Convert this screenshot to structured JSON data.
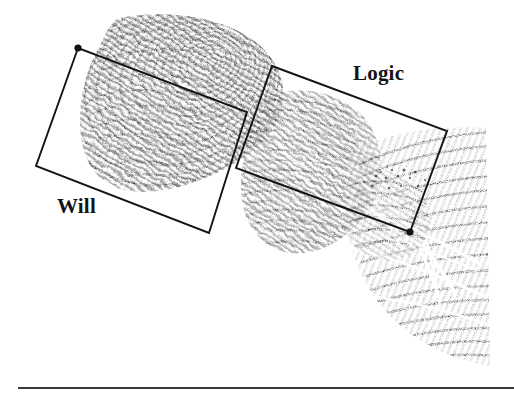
{
  "figure": {
    "caption_rule_visible": true,
    "background_color": "#ffffff",
    "ink_color": "#141414",
    "media": {
      "kind": "scanned-photograph",
      "subject": "fingerprint-impression",
      "description": "Rolled fingerprint and finger-joint impressions running diagonally from upper left to lower right"
    },
    "annotations": [
      {
        "id": "will",
        "label": "Will",
        "region": "upper-left fingertip whorl impression",
        "marker": "leader-dot",
        "box_corners": [
          [
            78,
            48
          ],
          [
            36,
            166
          ],
          [
            209,
            233
          ],
          [
            247,
            112
          ]
        ],
        "dot": [
          78,
          48
        ],
        "label_position": [
          57,
          194
        ]
      },
      {
        "id": "logic",
        "label": "Logic",
        "region": "middle and lower finger-joint impressions",
        "marker": "leader-dot",
        "box_corners": [
          [
            272,
            66
          ],
          [
            447,
            131
          ],
          [
            410,
            232
          ],
          [
            236,
            168
          ]
        ],
        "dot": [
          410,
          232
        ],
        "label_position": [
          353,
          61
        ]
      }
    ],
    "rule": {
      "x1": 18,
      "x2": 514,
      "y": 388,
      "thickness": 2
    }
  }
}
